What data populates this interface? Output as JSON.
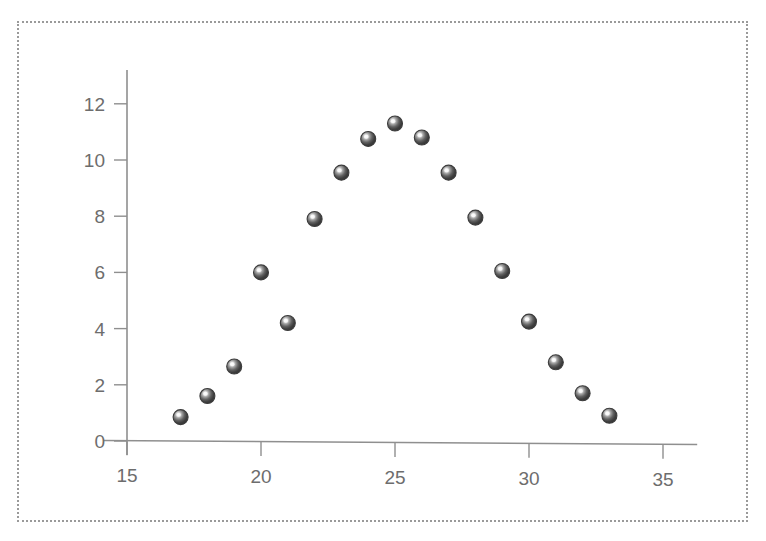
{
  "chart_data": {
    "type": "scatter",
    "title": "",
    "subtitle": "",
    "xlabel": "",
    "ylabel": "",
    "xlim": [
      14.2,
      36.5
    ],
    "ylim": [
      0,
      13.2
    ],
    "xticks": [
      15,
      20,
      25,
      30,
      35
    ],
    "yticks": [
      0,
      2,
      4,
      6,
      8,
      10,
      12
    ],
    "xtick_labels": [
      "15",
      "20",
      "25",
      "30",
      "35"
    ],
    "ytick_labels": [
      "0",
      "2",
      "4",
      "6",
      "8",
      "10",
      "12"
    ],
    "grid": false,
    "legend": null,
    "annotations": [],
    "marker_style": "sphere-3d",
    "marker_color": "#4a4a4a",
    "marker_size": 15,
    "series": [
      {
        "name": "series-1",
        "x": [
          17,
          18,
          19,
          20,
          21,
          22,
          23,
          24,
          25,
          26,
          27,
          28,
          29,
          30,
          31,
          32,
          33
        ],
        "y": [
          0.85,
          1.6,
          2.65,
          6.0,
          4.2,
          7.9,
          9.55,
          10.75,
          11.3,
          10.8,
          9.55,
          7.95,
          6.05,
          4.25,
          2.8,
          1.7,
          0.9
        ],
        "points": [
          {
            "x": 17,
            "y": 0.85
          },
          {
            "x": 18,
            "y": 1.6
          },
          {
            "x": 19,
            "y": 2.65
          },
          {
            "x": 20,
            "y": 6.0
          },
          {
            "x": 21,
            "y": 4.2
          },
          {
            "x": 22,
            "y": 7.9
          },
          {
            "x": 23,
            "y": 9.55
          },
          {
            "x": 24,
            "y": 10.75
          },
          {
            "x": 25,
            "y": 11.3
          },
          {
            "x": 26,
            "y": 10.8
          },
          {
            "x": 27,
            "y": 9.55
          },
          {
            "x": 28,
            "y": 7.95
          },
          {
            "x": 29,
            "y": 6.05
          },
          {
            "x": 30,
            "y": 4.25
          },
          {
            "x": 31,
            "y": 2.8
          },
          {
            "x": 32,
            "y": 1.7
          },
          {
            "x": 33,
            "y": 0.9
          }
        ]
      }
    ]
  },
  "style": {
    "axis_color": "#8f8f8f",
    "tick_label_color": "#6d6d6d",
    "border_color": "#9a9a9a",
    "background": "#ffffff",
    "marker_dark": "#2f2f2f",
    "marker_mid": "#5a5a5a",
    "marker_highlight": "#f2f2f2"
  }
}
